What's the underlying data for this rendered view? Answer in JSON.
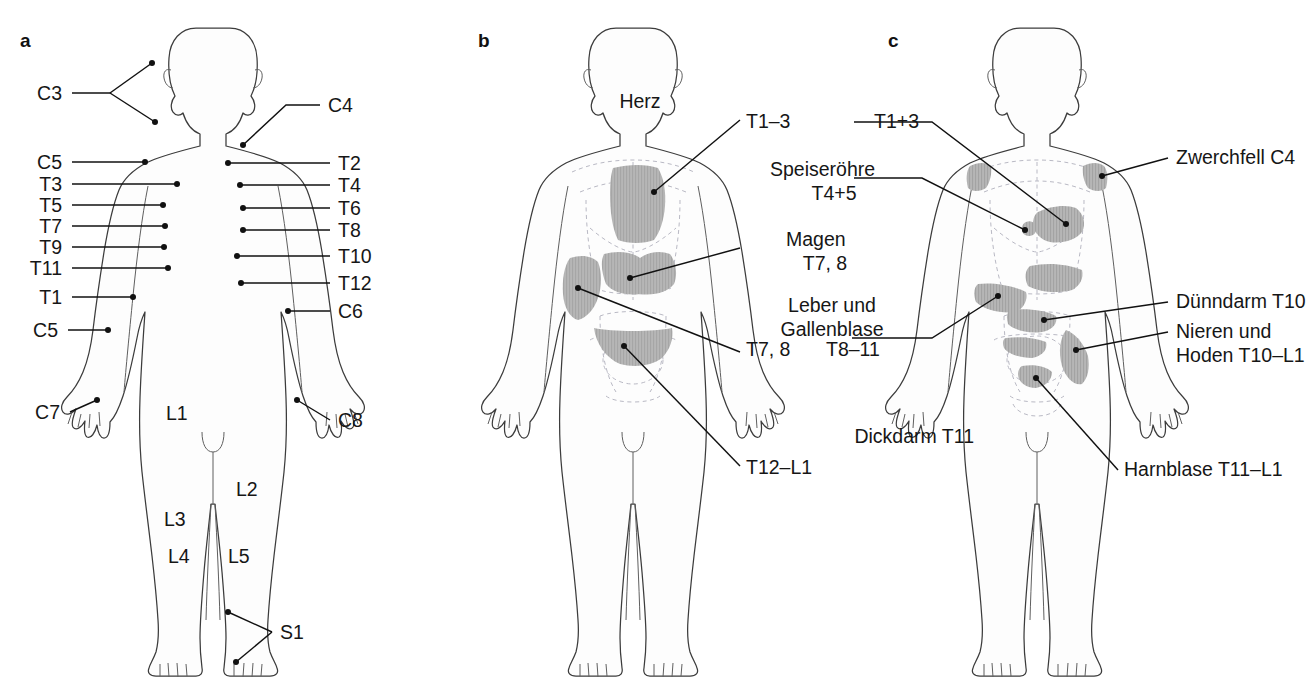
{
  "figure": {
    "panels": [
      {
        "letter": "a",
        "name": "dermatomes-front"
      },
      {
        "letter": "b",
        "name": "referred-pain-head-zones-front"
      },
      {
        "letter": "c",
        "name": "referred-pain-organ-zones-front"
      }
    ]
  },
  "panel_a": {
    "letter": "a",
    "left_labels": [
      {
        "text": "C3"
      },
      {
        "text": "C5"
      },
      {
        "text": "T3"
      },
      {
        "text": "T5"
      },
      {
        "text": "T7"
      },
      {
        "text": "T9"
      },
      {
        "text": "T11"
      },
      {
        "text": "T1"
      },
      {
        "text": "C5"
      },
      {
        "text": "C7"
      }
    ],
    "right_labels": [
      {
        "text": "C4"
      },
      {
        "text": "T2"
      },
      {
        "text": "T4"
      },
      {
        "text": "T6"
      },
      {
        "text": "T8"
      },
      {
        "text": "T10"
      },
      {
        "text": "T12"
      },
      {
        "text": "C6"
      },
      {
        "text": "C8"
      },
      {
        "text": "S1"
      }
    ],
    "inline_labels": [
      {
        "text": "L1"
      },
      {
        "text": "L2"
      },
      {
        "text": "L3"
      },
      {
        "text": "L4"
      },
      {
        "text": "L5"
      }
    ]
  },
  "panel_b": {
    "letter": "b",
    "labels": [
      {
        "text": "T1–3",
        "name": "heart-segment-b"
      },
      {
        "text": "T7, 8",
        "name": "liver-gallbladder-segment-b"
      },
      {
        "text": "T12–L1",
        "name": "colon-segment-b"
      }
    ]
  },
  "panel_c": {
    "letter": "c",
    "labels": [
      {
        "text": "T1+3",
        "name": "heart-segment-c"
      },
      {
        "text": "T8–11",
        "name": "liver-gallbladder-segment-c"
      },
      {
        "text": "Zwerchfell C4",
        "name": "diaphragm-label"
      },
      {
        "text": "Dünndarm T10",
        "name": "small-intestine-label"
      },
      {
        "text": "Nieren und",
        "name": "kidneys-testes-label-line1"
      },
      {
        "text": "Hoden T10–L1",
        "name": "kidneys-testes-label-line2"
      },
      {
        "text": "Dickdarm T11",
        "name": "large-intestine-label"
      },
      {
        "text": "Harnblase T11–L1",
        "name": "bladder-label"
      }
    ]
  },
  "shared_organ_labels": {
    "heart": {
      "name": "Herz"
    },
    "esophagus": {
      "name": "Speiseröhre",
      "segments": "T4+5"
    },
    "stomach": {
      "name": "Magen",
      "segments": "T7, 8"
    },
    "liver": {
      "line1": "Leber und",
      "line2": "Gallenblase"
    }
  },
  "colors": {
    "dermatome_fill": "#b0b0b0",
    "outline": "#3c3c3c",
    "leader": "#111111",
    "dashed_organ": "#b9b9c4",
    "text": "#161616",
    "background": "#ffffff"
  }
}
